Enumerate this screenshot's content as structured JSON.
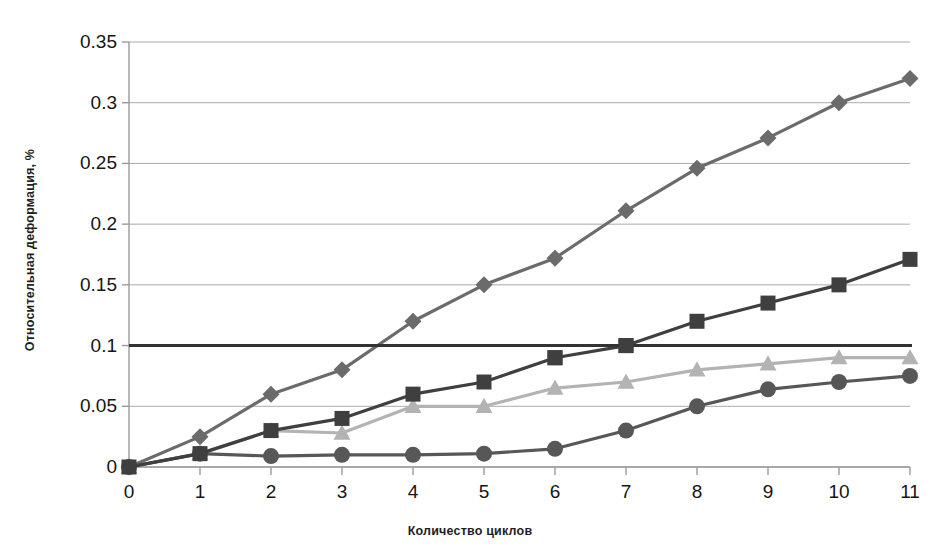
{
  "chart_data": {
    "type": "line",
    "title": "",
    "subtitle": "",
    "xlabel": "Количество циклов",
    "ylabel": "Относительная деформация, %",
    "x": [
      0,
      1,
      2,
      3,
      4,
      5,
      6,
      7,
      8,
      9,
      10,
      11
    ],
    "xlim": [
      0,
      11
    ],
    "ylim": [
      0,
      0.35
    ],
    "xticks": [
      "0",
      "1",
      "2",
      "3",
      "4",
      "5",
      "6",
      "7",
      "8",
      "9",
      "10",
      "11"
    ],
    "yticks": [
      "0",
      "0.05",
      "0.1",
      "0.15",
      "0.2",
      "0.25",
      "0.3",
      "0.35"
    ],
    "ytick_values": [
      0,
      0.05,
      0.1,
      0.15,
      0.2,
      0.25,
      0.3,
      0.35
    ],
    "grid": true,
    "grid_axis": "y",
    "legend": false,
    "legend_position": "none",
    "series": [
      {
        "name": "series-1",
        "marker": "diamond",
        "color": "#6b6b6b",
        "values": [
          0,
          0.025,
          0.06,
          0.08,
          0.12,
          0.15,
          0.172,
          0.211,
          0.246,
          0.271,
          0.3,
          0.32
        ]
      },
      {
        "name": "series-2",
        "marker": "square",
        "color": "#3f3f3f",
        "values": [
          0,
          0.011,
          0.03,
          0.04,
          0.06,
          0.07,
          0.09,
          0.1,
          0.12,
          0.135,
          0.15,
          0.171
        ]
      },
      {
        "name": "series-3",
        "marker": "triangle",
        "color": "#b3b3b3",
        "values": [
          0,
          0.011,
          0.03,
          0.028,
          0.05,
          0.05,
          0.065,
          0.07,
          0.08,
          0.085,
          0.09,
          0.09
        ]
      },
      {
        "name": "series-4",
        "marker": "circle",
        "color": "#575757",
        "values": [
          0,
          0.011,
          0.009,
          0.01,
          0.01,
          0.011,
          0.015,
          0.03,
          0.05,
          0.064,
          0.07,
          0.075
        ]
      }
    ],
    "threshold_line": {
      "name": "limit-line",
      "value": 0.1,
      "color": "#333333"
    },
    "colors": {
      "axis": "#9a9a9a",
      "gridline": "#aaaaaa",
      "text": "#151515",
      "background": "#ffffff"
    }
  }
}
